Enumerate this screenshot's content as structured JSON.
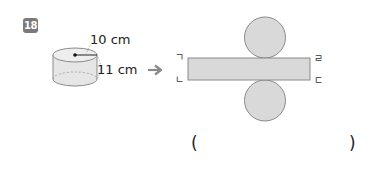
{
  "problem": {
    "number": "18"
  },
  "cylinder": {
    "radius_label": "10 cm",
    "height_label": "11 cm"
  },
  "arrow": {
    "icon": "right-arrow-icon",
    "color": "#8a8a8a"
  },
  "net": {
    "fill_color": "#d9d9d9",
    "stroke_color": "#8a8a8a",
    "corner_labels": {
      "top_left": "ㄱ",
      "bottom_left": "ㄴ",
      "top_right": "ㄹ",
      "bottom_right": "ㄷ"
    }
  },
  "answer": {
    "open_paren": "(",
    "close_paren": ")",
    "value": ""
  }
}
